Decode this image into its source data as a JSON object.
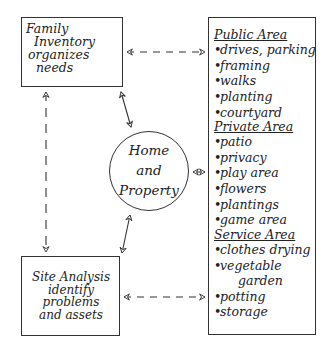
{
  "diagram": {
    "nodes": {
      "family_inventory": {
        "lines": [
          "Family",
          "Inventory",
          "organizes",
          "needs"
        ]
      },
      "home_property": {
        "lines": [
          "Home",
          "and",
          "Property"
        ]
      },
      "site_analysis": {
        "lines": [
          "Site Analysis",
          "identify",
          "problems",
          "and assets"
        ]
      },
      "areas": {
        "public": {
          "heading": "Public Area",
          "items": [
            "drives, parking",
            "framing",
            "walks",
            "planting",
            "courtyard"
          ]
        },
        "private": {
          "heading": "Private Area",
          "items": [
            "patio",
            "privacy",
            "play area",
            "flowers",
            "plantings",
            "game area"
          ]
        },
        "service": {
          "heading": "Service Area",
          "items": [
            "clothes drying",
            "vegetable",
            "garden",
            "potting",
            "storage"
          ]
        }
      }
    },
    "edges": [
      {
        "from": "family_inventory",
        "to": "areas",
        "style": "dashed",
        "direction": "both"
      },
      {
        "from": "family_inventory",
        "to": "home_property",
        "style": "solid",
        "direction": "both"
      },
      {
        "from": "family_inventory",
        "to": "site_analysis",
        "style": "dashed",
        "direction": "both"
      },
      {
        "from": "home_property",
        "to": "areas",
        "style": "solid",
        "direction": "both"
      },
      {
        "from": "home_property",
        "to": "site_analysis",
        "style": "solid",
        "direction": "both"
      },
      {
        "from": "site_analysis",
        "to": "areas",
        "style": "dashed",
        "direction": "both"
      }
    ],
    "bullet": "•",
    "stroke_color": "#333333"
  }
}
